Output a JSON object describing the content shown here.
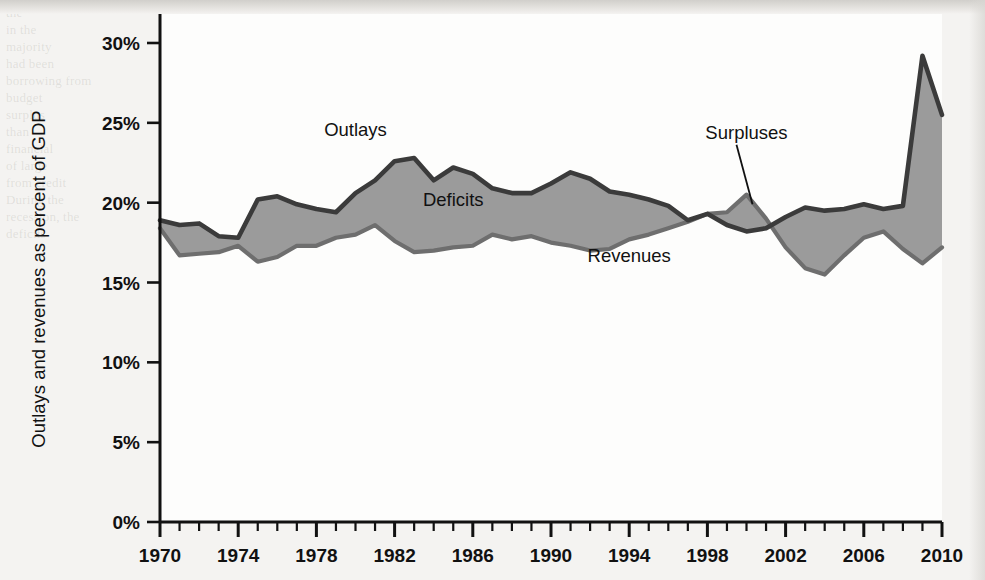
{
  "figure": {
    "y_axis_title": "Outlays and revenues as percent of GDP",
    "accent_fill": "#9b9b9b",
    "outlays_color": "#3b3b3b",
    "revenues_color": "#6e6e6e",
    "axis_color": "#111111",
    "plot_background": "#fdfdfc",
    "page_background": "#f4f3f1"
  },
  "annotations": {
    "outlays": "Outlays",
    "deficits": "Deficits",
    "revenues": "Revenues",
    "surpluses": "Surpluses"
  },
  "background_text": {
    "col_left": "the\nin the\nmajority\nhad been\nborrowing from\nbudget\nsurplus\nthan\nfinancial\nof large\nfrom credit\nDuring the\nrecession, the\ndeficits",
    "col_mid": "government\nrecognized\nthe\nsurplus and\nthe market\nof the\nfederal debt\nwas\nlarge\nmarkets\nthe government\nstimulus and\nrevenue",
    "col_right": "the\nexpansion\nof the decade\nreduced\ndeficit\nthe economy\nprivate\nresponded\nspending\nconditions\ndeclines",
    "col_far_right": "out\nand\nthe\nthat\nmarket"
  },
  "chart_data": {
    "type": "area",
    "title": "",
    "xlabel": "",
    "ylabel": "Outlays and revenues as percent of GDP",
    "xlim": [
      1970,
      2010
    ],
    "ylim": [
      0,
      31
    ],
    "ytick_values": [
      0,
      5,
      10,
      15,
      20,
      25,
      30
    ],
    "ytick_labels": [
      "0%",
      "5%",
      "10%",
      "15%",
      "20%",
      "25%",
      "30%"
    ],
    "xtick_values": [
      1970,
      1974,
      1978,
      1982,
      1986,
      1990,
      1994,
      1998,
      2002,
      2006,
      2010
    ],
    "xtick_labels": [
      "1970",
      "1974",
      "1978",
      "1982",
      "1986",
      "1990",
      "1994",
      "1998",
      "2002",
      "2006",
      "2010"
    ],
    "xtick_minor_step": 1,
    "grid": false,
    "legend_position": "inline-annotations",
    "x": [
      1970,
      1971,
      1972,
      1973,
      1974,
      1975,
      1976,
      1977,
      1978,
      1979,
      1980,
      1981,
      1982,
      1983,
      1984,
      1985,
      1986,
      1987,
      1988,
      1989,
      1990,
      1991,
      1992,
      1993,
      1994,
      1995,
      1996,
      1997,
      1998,
      1999,
      2000,
      2001,
      2002,
      2003,
      2004,
      2005,
      2006,
      2007,
      2008,
      2009,
      2010
    ],
    "series": [
      {
        "name": "Outlays",
        "color": "#3b3b3b",
        "values": [
          18.9,
          18.6,
          18.7,
          17.9,
          17.8,
          20.2,
          20.4,
          19.9,
          19.6,
          19.4,
          20.6,
          21.4,
          22.6,
          22.8,
          21.4,
          22.2,
          21.8,
          20.9,
          20.6,
          20.6,
          21.2,
          21.9,
          21.5,
          20.7,
          20.5,
          20.2,
          19.8,
          18.9,
          19.3,
          18.6,
          18.2,
          18.4,
          19.1,
          19.7,
          19.5,
          19.6,
          19.9,
          19.6,
          19.8,
          29.2,
          25.5
        ]
      },
      {
        "name": "Revenues",
        "color": "#6e6e6e",
        "values": [
          18.4,
          16.7,
          16.8,
          16.9,
          17.3,
          16.3,
          16.6,
          17.3,
          17.3,
          17.8,
          18.0,
          18.6,
          17.6,
          16.9,
          17.0,
          17.2,
          17.3,
          18.0,
          17.7,
          17.9,
          17.5,
          17.3,
          17.0,
          17.1,
          17.7,
          18.0,
          18.4,
          18.8,
          19.3,
          19.4,
          20.5,
          19.0,
          17.2,
          15.9,
          15.5,
          16.7,
          17.8,
          18.2,
          17.1,
          16.2,
          17.2
        ]
      }
    ],
    "annotations": [
      {
        "text": "Outlays",
        "x": 1980,
        "y": 24.2
      },
      {
        "text": "Deficits",
        "x": 1985,
        "y": 19.8
      },
      {
        "text": "Revenues",
        "x": 1994,
        "y": 16.3
      },
      {
        "text": "Surpluses",
        "x": 2000,
        "y": 24.0
      }
    ]
  }
}
